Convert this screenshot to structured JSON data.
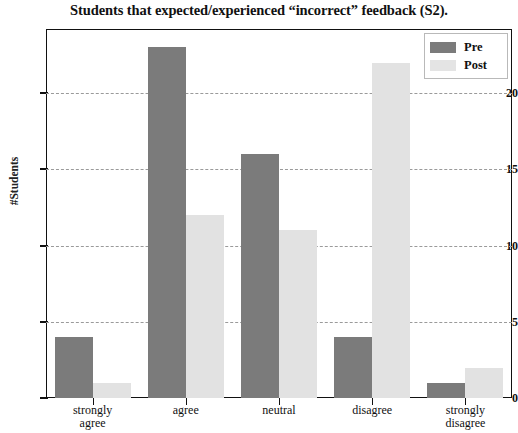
{
  "chart_data": {
    "type": "bar",
    "title": "Students that expected/experienced “incorrect” feedback (S2).",
    "xlabel": "",
    "ylabel": "#Students",
    "categories": [
      "strongly agree",
      "agree",
      "neutral",
      "disagree",
      "strongly disagree"
    ],
    "category_lines": [
      [
        "strongly",
        "agree"
      ],
      [
        "agree",
        ""
      ],
      [
        "neutral",
        ""
      ],
      [
        "disagree",
        ""
      ],
      [
        "strongly",
        "disagree"
      ]
    ],
    "series": [
      {
        "name": "Pre",
        "color": "#7b7b7b",
        "values": [
          4,
          23,
          16,
          4,
          1
        ]
      },
      {
        "name": "Post",
        "color": "#e2e2e2",
        "values": [
          1,
          12,
          11,
          22,
          2
        ]
      }
    ],
    "ylim": [
      0,
      24.2
    ],
    "yticks": [
      0,
      5,
      10,
      15,
      20
    ],
    "ytick_labels": [
      "0",
      "5",
      "10",
      "15",
      "20"
    ],
    "gridlines": [
      5,
      10,
      15,
      20
    ],
    "grid": true,
    "grid_style": "dashed",
    "legend_position": "top-right",
    "legend_entries": [
      "Pre",
      "Post"
    ]
  }
}
